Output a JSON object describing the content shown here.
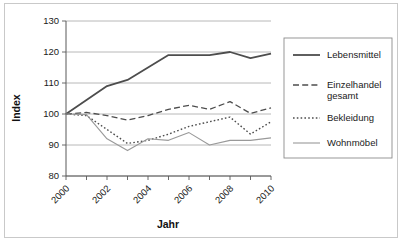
{
  "chart_data": {
    "type": "line",
    "title": "",
    "xlabel": "Jahr",
    "ylabel": "Index",
    "x": [
      2000,
      2001,
      2002,
      2003,
      2004,
      2005,
      2006,
      2007,
      2008,
      2009,
      2010
    ],
    "xlim": [
      2000,
      2010
    ],
    "ylim": [
      80,
      130
    ],
    "yticks": [
      80,
      90,
      100,
      110,
      120,
      130
    ],
    "ytick_labels": [
      "80",
      "90",
      "100",
      "110",
      "120",
      "130"
    ],
    "xticks": [
      2000,
      2001,
      2002,
      2003,
      2004,
      2005,
      2006,
      2007,
      2008,
      2009,
      2010
    ],
    "xtick_labels_shown": [
      "2000",
      "2002",
      "2004",
      "2006",
      "2008",
      "2010"
    ],
    "xtick_label_rotation": -45,
    "grid": "horizontal",
    "legend_position": "right",
    "series": [
      {
        "name": "Lebensmittel",
        "style": "solid",
        "color": "#4d4d4d",
        "width": 1.8,
        "values": [
          100,
          104.5,
          109,
          111,
          115,
          119,
          119,
          119,
          120,
          118,
          119.5
        ]
      },
      {
        "name": "Einzelhandel gesamt",
        "style": "dashed",
        "color": "#4d4d4d",
        "width": 1.3,
        "values": [
          100,
          100.5,
          99.5,
          98,
          99.5,
          101.5,
          102.8,
          101.5,
          104,
          100.2,
          102
        ]
      },
      {
        "name": "Bekleidung",
        "style": "dotted",
        "color": "#4d4d4d",
        "width": 1.4,
        "values": [
          100,
          99.5,
          95,
          90.5,
          91.5,
          93.5,
          96,
          97.5,
          99,
          93.5,
          97.5
        ]
      },
      {
        "name": "Wohnmöbel",
        "style": "solid",
        "color": "#999999",
        "width": 1.1,
        "values": [
          100,
          99.8,
          92,
          88.2,
          92,
          91.5,
          94,
          90,
          91.5,
          91.5,
          92.3
        ]
      }
    ]
  },
  "axes": {
    "y_title": "Index",
    "x_title": "Jahr"
  },
  "legend": {
    "entries": [
      {
        "label": "Lebensmittel"
      },
      {
        "label": "Einzelhandel",
        "label2": "gesamt"
      },
      {
        "label": "Bekleidung"
      },
      {
        "label": "Wohnmöbel"
      }
    ]
  }
}
